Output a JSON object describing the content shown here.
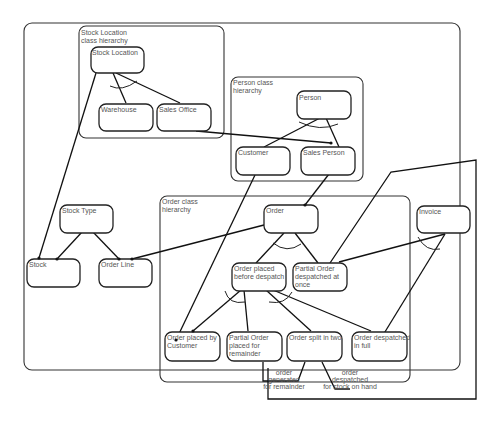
{
  "diagram": {
    "groups": [
      {
        "id": "stock-location-group",
        "label": [
          "Stock Location",
          "class hierarchy"
        ]
      },
      {
        "id": "person-group",
        "label": [
          "Person class",
          "hierarchy"
        ]
      },
      {
        "id": "order-group",
        "label": [
          "Order class",
          "hierarchy"
        ]
      }
    ],
    "nodes": [
      {
        "id": "stock-location",
        "label": [
          "Stock Location"
        ]
      },
      {
        "id": "warehouse",
        "label": [
          "Warehouse"
        ]
      },
      {
        "id": "sales-office",
        "label": [
          "Sales Office"
        ]
      },
      {
        "id": "person",
        "label": [
          "Person"
        ]
      },
      {
        "id": "customer",
        "label": [
          "Customer"
        ]
      },
      {
        "id": "sales-person",
        "label": [
          "Sales Person"
        ]
      },
      {
        "id": "stock-type",
        "label": [
          "Stock Type"
        ]
      },
      {
        "id": "stock",
        "label": [
          "Stock"
        ]
      },
      {
        "id": "order-line",
        "label": [
          "Order Line"
        ]
      },
      {
        "id": "order",
        "label": [
          "Order"
        ]
      },
      {
        "id": "invoice",
        "label": [
          "Invoice"
        ]
      },
      {
        "id": "order-placed-before-despatch",
        "label": [
          "Order placed",
          "before despatch"
        ]
      },
      {
        "id": "partial-order-despatched-at-once",
        "label": [
          "Partial Order",
          "despatched at",
          "once"
        ]
      },
      {
        "id": "order-placed-by-customer",
        "label": [
          "Order placed by",
          "Customer"
        ]
      },
      {
        "id": "partial-order-placed-for-remainder",
        "label": [
          "Partial Order",
          "placed for",
          "remainder"
        ]
      },
      {
        "id": "order-split-in-two",
        "label": [
          "Order split in two"
        ]
      },
      {
        "id": "order-despatched-in-full",
        "label": [
          "Order despatched",
          "in full"
        ]
      }
    ],
    "edge_labels": [
      {
        "id": "order-generated-for-remainder",
        "label": [
          "order",
          "generated",
          "for remainder"
        ]
      },
      {
        "id": "order-despatched-for-stock-on-hand",
        "label": [
          "order",
          "despatched",
          "for stock on hand"
        ]
      }
    ],
    "edges": [
      {
        "from": "stock-location",
        "to": "warehouse",
        "kind": "subtype"
      },
      {
        "from": "stock-location",
        "to": "sales-office",
        "kind": "subtype"
      },
      {
        "from": "stock-location",
        "to": "stock",
        "kind": "association"
      },
      {
        "from": "sales-office",
        "to": "sales-person",
        "kind": "association"
      },
      {
        "from": "person",
        "to": "customer",
        "kind": "subtype"
      },
      {
        "from": "person",
        "to": "sales-person",
        "kind": "subtype"
      },
      {
        "from": "customer",
        "to": "order-placed-by-customer",
        "kind": "association"
      },
      {
        "from": "sales-person",
        "to": "order",
        "kind": "association"
      },
      {
        "from": "stock-type",
        "to": "stock",
        "kind": "association"
      },
      {
        "from": "stock-type",
        "to": "order-line",
        "kind": "association"
      },
      {
        "from": "order",
        "to": "order-line",
        "kind": "association"
      },
      {
        "from": "order",
        "to": "order-placed-before-despatch",
        "kind": "subtype"
      },
      {
        "from": "order",
        "to": "partial-order-despatched-at-once",
        "kind": "subtype"
      },
      {
        "from": "invoice",
        "to": "partial-order-despatched-at-once",
        "kind": "association"
      },
      {
        "from": "invoice",
        "to": "order-despatched-in-full",
        "kind": "association"
      },
      {
        "from": "partial-order-despatched-at-once",
        "to": "outer-loop",
        "kind": "association"
      },
      {
        "from": "order-placed-before-despatch",
        "to": "order-placed-by-customer",
        "kind": "subtype"
      },
      {
        "from": "order-placed-before-despatch",
        "to": "partial-order-placed-for-remainder",
        "kind": "subtype"
      },
      {
        "from": "order-placed-before-despatch",
        "to": "order-split-in-two",
        "kind": "subtype"
      },
      {
        "from": "order-placed-before-despatch",
        "to": "order-despatched-in-full",
        "kind": "subtype"
      },
      {
        "from": "order-split-in-two",
        "to": "partial-order-placed-for-remainder",
        "kind": "association",
        "label": "order-generated-for-remainder"
      },
      {
        "from": "order-split-in-two",
        "to": "order-despatched-in-full",
        "kind": "association",
        "label": "order-despatched-for-stock-on-hand"
      }
    ]
  }
}
